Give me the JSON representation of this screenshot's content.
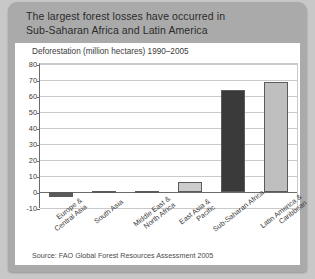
{
  "header": {
    "line1": "The largest forest losses have occurred in",
    "line2": "Sub-Saharan Africa and Latin America"
  },
  "source": "Source: FAO Global Forest Resources Assessment 2005",
  "colors": {
    "card": "#aaaaaa",
    "panel": "#ffffff",
    "bar_light": "#bfbfbf",
    "bar_dark": "#3a3a3a",
    "grid": "#c9c9c9",
    "axis": "#6b6b6b"
  },
  "chart_data": {
    "type": "bar",
    "title": "Deforestation (million hectares) 1990–2005",
    "xlabel": "",
    "ylabel": "",
    "ylim": [
      -10,
      80
    ],
    "yticks": [
      80,
      70,
      60,
      50,
      40,
      30,
      20,
      10,
      0,
      -10
    ],
    "grid": true,
    "legend": "none",
    "categories": [
      "Europe &\nCentral Asia",
      "South Asia",
      "Middle East &\nNorth Africa",
      "East Asia &\nPacific",
      "Sub-Saharan Africa",
      "Latin America &\nCaribbean"
    ],
    "category_lines": [
      [
        "Europe &",
        "Central Asia"
      ],
      [
        "South Asia"
      ],
      [
        "Middle East &",
        "North Africa"
      ],
      [
        "East Asia &",
        "Pacific"
      ],
      [
        "Sub-Saharan Africa"
      ],
      [
        "Latin America &",
        "Caribbean"
      ]
    ],
    "values": [
      -3,
      0.8,
      0.8,
      6,
      64,
      69
    ],
    "bar_colors": [
      "#5a5a5a",
      "#bfbfbf",
      "#8f8f8f",
      "#cccccc",
      "#3a3a3a",
      "#bfbfbf"
    ]
  }
}
